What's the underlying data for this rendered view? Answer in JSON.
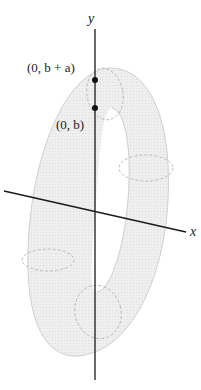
{
  "figure": {
    "type": "torus-diagram",
    "axes": {
      "y_label": "y",
      "x_label": "x"
    },
    "points": [
      {
        "label": "(0, b + a)",
        "name": "point-b-plus-a"
      },
      {
        "label": "(0, b)",
        "name": "point-b"
      }
    ],
    "colors": {
      "torus_fill": "#ececec",
      "torus_edge": "#c8c8c8",
      "axis": "#1a1a1a",
      "point": "#111111",
      "dashed": "#b5b5b5"
    }
  }
}
